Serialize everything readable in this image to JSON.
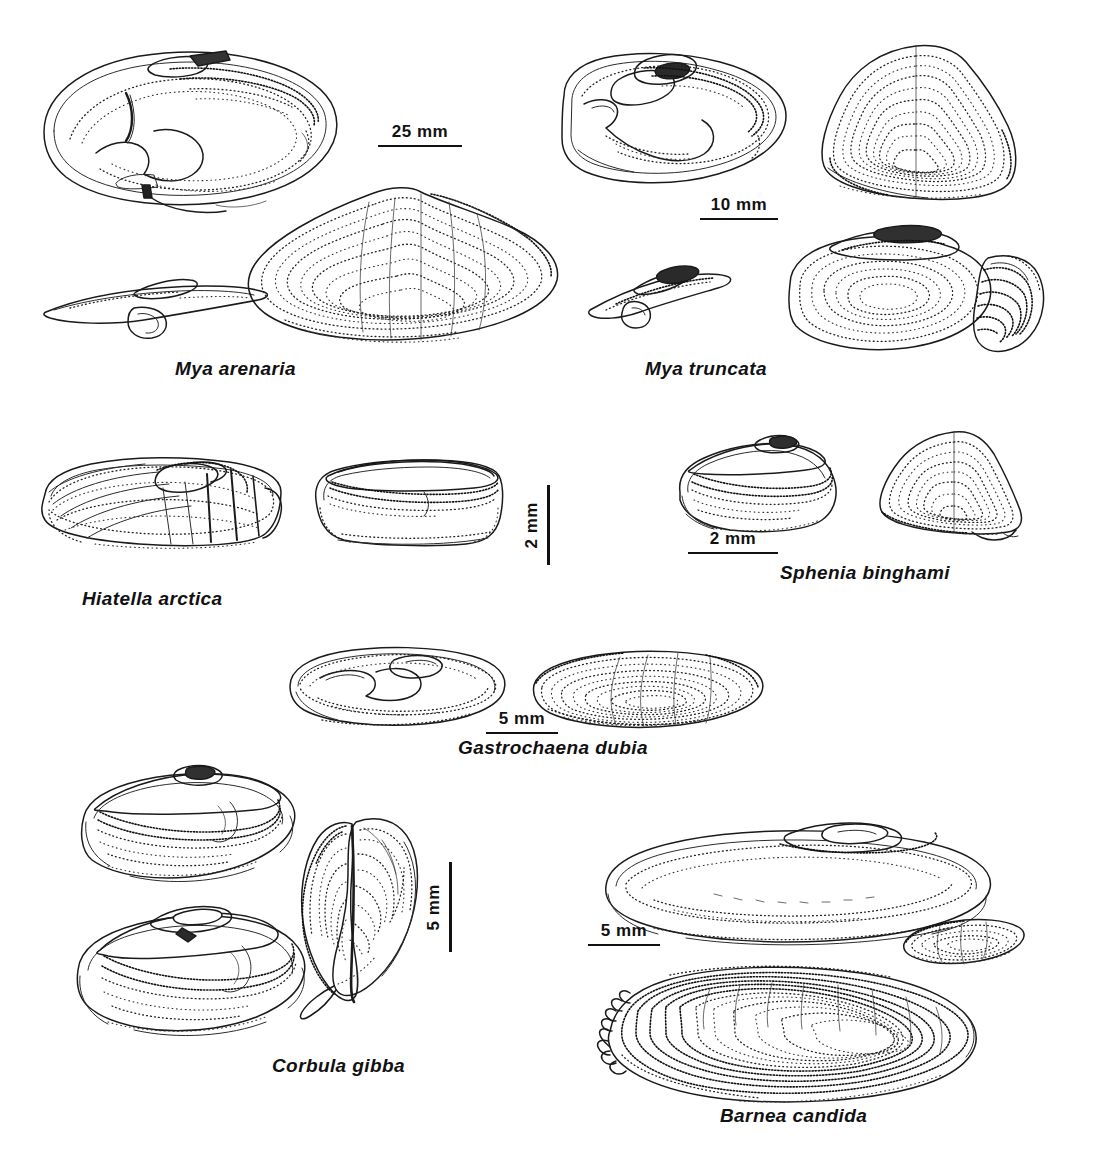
{
  "plate": {
    "title": "Bivalve shell identification plate",
    "background": "#ffffff",
    "ink_color": "#1a1a1a",
    "width": 1098,
    "height": 1151,
    "style": "stippled pen-and-ink scientific illustration"
  },
  "species": [
    {
      "name": "Mya arenaria",
      "label_x": 175,
      "label_y": 358,
      "views": [
        "left valve interior",
        "hinge / chondrophore detail",
        "right valve exterior"
      ],
      "scale": {
        "value": "25 mm",
        "orientation": "horizontal",
        "x": 378,
        "y": 123,
        "length": 84
      }
    },
    {
      "name": "Mya truncata",
      "label_x": 645,
      "label_y": 358,
      "views": [
        "left valve interior",
        "right valve exterior",
        "hinge detail",
        "valve with siphonal sheath"
      ],
      "scale": {
        "value": "10 mm",
        "orientation": "horizontal",
        "x": 700,
        "y": 196,
        "length": 78
      }
    },
    {
      "name": "Hiatella arctica",
      "label_x": 82,
      "label_y": 588,
      "views": [
        "left valve exterior",
        "right valve interior"
      ],
      "scale": {
        "value": "2 mm",
        "orientation": "vertical",
        "x": 522,
        "y": 485,
        "length": 80
      }
    },
    {
      "name": "Sphenia binghami",
      "label_x": 780,
      "label_y": 562,
      "views": [
        "left valve interior",
        "right valve exterior"
      ],
      "scale": {
        "value": "2 mm",
        "orientation": "horizontal",
        "x": 688,
        "y": 530,
        "length": 90
      }
    },
    {
      "name": "Gastrochaena dubia",
      "label_x": 458,
      "label_y": 737,
      "views": [
        "left valve interior",
        "right valve exterior"
      ],
      "scale": {
        "value": "5 mm",
        "orientation": "horizontal",
        "x": 486,
        "y": 710,
        "length": 72
      }
    },
    {
      "name": "Corbula gibba",
      "label_x": 272,
      "label_y": 1055,
      "views": [
        "right valve interior",
        "left valve interior",
        "anterior view of closed shell"
      ],
      "scale": {
        "value": "5 mm",
        "orientation": "vertical",
        "x": 424,
        "y": 862,
        "length": 90
      }
    },
    {
      "name": "Barnea candida",
      "label_x": 720,
      "label_y": 1105,
      "views": [
        "left valve interior",
        "apophysis detail",
        "right valve exterior"
      ],
      "scale": {
        "value": "5 mm",
        "orientation": "horizontal",
        "x": 588,
        "y": 922,
        "length": 72
      }
    }
  ]
}
